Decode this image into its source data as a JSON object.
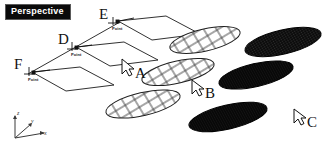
{
  "viewport": {
    "label": "Perspective",
    "background_color": "#ffffff",
    "label_background_color": "#0a0a0a",
    "label_text_color": "#ffffff",
    "width": 329,
    "height": 149
  },
  "axis_indicator": {
    "name": "xyz-axis-gizmo",
    "axes": [
      {
        "key": "z",
        "label": "z"
      },
      {
        "key": "y",
        "label": "y"
      },
      {
        "key": "x",
        "label": "x"
      }
    ],
    "color": "#3a3a3a"
  },
  "construction_points": [
    {
      "id": "E",
      "label": "E",
      "caption": "Point"
    },
    {
      "id": "D",
      "label": "D",
      "caption": "Point"
    },
    {
      "id": "F",
      "label": "F",
      "caption": "Point"
    }
  ],
  "planes": [
    {
      "id": "plane-top",
      "name": "plane-top"
    },
    {
      "id": "plane-middle",
      "name": "plane-middle"
    },
    {
      "id": "plane-bottom",
      "name": "plane-bottom"
    }
  ],
  "objects": [
    {
      "id": "A",
      "label": "A",
      "density": "coarse",
      "shade": "light",
      "has_cursor": true
    },
    {
      "id": "B",
      "label": "B",
      "density": "medium",
      "shade": "medium",
      "has_cursor": true
    },
    {
      "id": "C",
      "label": "C",
      "density": "fine",
      "shade": "dark",
      "has_cursor": true
    }
  ],
  "cursors": [
    {
      "id": "cursor-a",
      "for": "A"
    },
    {
      "id": "cursor-b",
      "for": "B"
    },
    {
      "id": "cursor-c",
      "for": "C"
    }
  ],
  "colors": {
    "line": "#1a1a1a",
    "mesh_light": "#2b2b2b",
    "mesh_dark": "#0d0d0d",
    "text": "#111111"
  }
}
